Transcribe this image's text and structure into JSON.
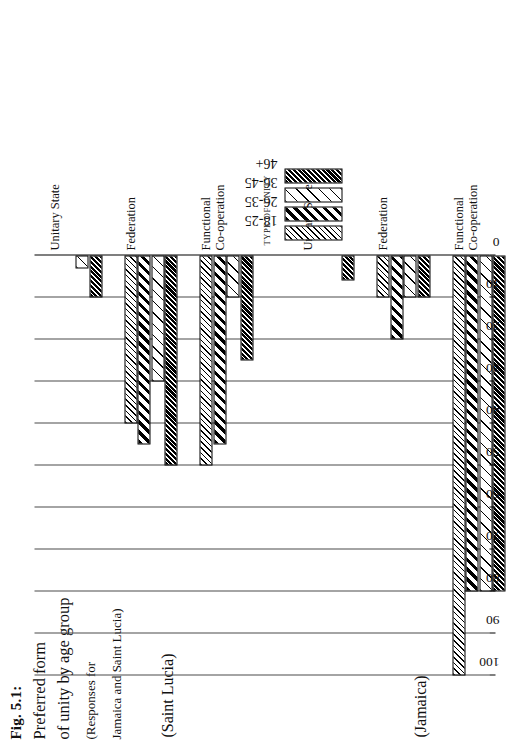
{
  "figure": {
    "number_label": "Fig. 5.1:",
    "title_line1": "Preferred form",
    "title_line2": "of unity by age group",
    "subtitle_line1": "(Responses for",
    "subtitle_line2": "Jamaica and Saint Lucia)"
  },
  "panels": {
    "jamaica_label": "(Jamaica)",
    "saint_lucia_label": "(Saint Lucia)"
  },
  "axes": {
    "value_axis_title": "PER CENT",
    "category_axis_title": "TYPE OF UNITY",
    "value_ticks": [
      "100",
      "90",
      "80",
      "70",
      "60",
      "50",
      "40",
      "30",
      "20",
      "10",
      "0"
    ]
  },
  "legend": {
    "entries": [
      {
        "label": "18-25",
        "pattern": "fine-diagonal-hatch"
      },
      {
        "label": "26-35",
        "pattern": "bold-diagonal-hatch"
      },
      {
        "label": "36-45",
        "pattern": "sparse-diagonal-hatch"
      },
      {
        "label": "46+",
        "pattern": "dense-dark-diagonal-hatch"
      }
    ]
  },
  "chart_data": {
    "type": "bar",
    "title": "Fig. 5.1: Preferred form of unity by age group (Responses for Jamaica and Saint Lucia)",
    "xlabel": "TYPE OF UNITY",
    "ylabel": "PER CENT",
    "ylim": [
      0,
      100
    ],
    "ytick_step": 10,
    "grid": true,
    "orientation": "horizontal-bars-rotated-page",
    "legend_position": "right",
    "categories": [
      "Functional Co-operation",
      "Federation",
      "Unitary State"
    ],
    "series": [
      {
        "name": "18-25",
        "pattern": "fine-diagonal-hatch"
      },
      {
        "name": "26-35",
        "pattern": "bold-diagonal-hatch"
      },
      {
        "name": "36-45",
        "pattern": "sparse-diagonal-hatch"
      },
      {
        "name": "46+",
        "pattern": "dense-dark-diagonal-hatch"
      }
    ],
    "panels": [
      {
        "panel": "(Jamaica)",
        "values": {
          "Functional Co-operation": [
            100,
            80,
            80,
            80
          ],
          "Federation": [
            10,
            20,
            10,
            10
          ],
          "Unitary State": [
            0,
            0,
            0,
            6
          ]
        }
      },
      {
        "panel": "(Saint Lucia)",
        "values": {
          "Functional Co-operation": [
            50,
            45,
            10,
            25
          ],
          "Federation": [
            40,
            45,
            30,
            50
          ],
          "Unitary State": [
            0,
            0,
            3,
            10
          ]
        }
      }
    ]
  }
}
